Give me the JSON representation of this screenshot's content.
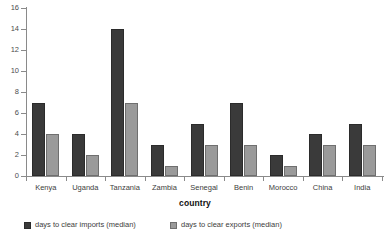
{
  "chart_data": {
    "type": "bar",
    "title": "",
    "subtitle": "",
    "xlabel": "country",
    "ylabel": "",
    "ylim": [
      0,
      16
    ],
    "yticks": [
      0,
      2,
      4,
      6,
      8,
      10,
      12,
      14,
      16
    ],
    "grid": false,
    "legend_position": "bottom-left",
    "categories": [
      "Kenya",
      "Uganda",
      "Tanzania",
      "Zambia",
      "Senegal",
      "Benin",
      "Morocco",
      "China",
      "India"
    ],
    "series": [
      {
        "name": "days to clear imports (median)",
        "color": "#3a3a3a",
        "values": [
          7,
          4,
          14,
          3,
          5,
          7,
          2,
          4,
          5
        ]
      },
      {
        "name": "days to clear exports (median)",
        "color": "#9a9a9a",
        "values": [
          4,
          2,
          7,
          1,
          3,
          3,
          1,
          3,
          3
        ]
      }
    ]
  },
  "colors": {
    "imports": "#3a3a3a",
    "imports_edge": "#2b2b2b",
    "exports": "#9a9a9a",
    "exports_edge": "#6f6f6f",
    "axis": "#8a8a8a",
    "text": "#3d3d3d",
    "background": "#ffffff"
  },
  "axis": {
    "y_tick_labels": [
      "0",
      "2",
      "4",
      "6",
      "8",
      "10",
      "12",
      "14",
      "16"
    ],
    "x_title": "country"
  },
  "legend": {
    "items": [
      {
        "label": "days to clear imports (median)"
      },
      {
        "label": "days to clear exports (median)"
      }
    ]
  }
}
